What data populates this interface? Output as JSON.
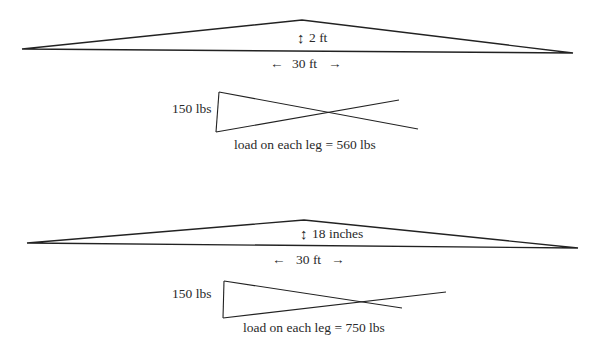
{
  "colors": {
    "background": "#ffffff",
    "line": "#222222",
    "text": "#2a2a2a"
  },
  "diagrams": [
    {
      "id": "truss-2ft",
      "span_label": "30 ft",
      "height_label": "2 ft",
      "arrow_left": "←",
      "arrow_right": "→",
      "updown_arrow": "↕",
      "triangle": {
        "left": [
          22,
          49
        ],
        "apex": [
          302,
          20
        ],
        "right": [
          573,
          53
        ]
      },
      "detail": {
        "force_label": "150 lbs",
        "load_label": "load on each leg = 560 lbs",
        "vertical": [
          [
            219,
            92
          ],
          [
            216,
            132
          ]
        ],
        "leg_a": [
          [
            219,
            92
          ],
          [
            418,
            129
          ]
        ],
        "leg_b": [
          [
            216,
            132
          ],
          [
            399,
            100
          ]
        ]
      }
    },
    {
      "id": "truss-18in",
      "span_label": "30 ft",
      "height_label": "18 inches",
      "arrow_left": "←",
      "arrow_right": "→",
      "updown_arrow": "↕",
      "triangle": {
        "left": [
          27,
          243
        ],
        "apex": [
          304,
          220
        ],
        "right": [
          578,
          248
        ]
      },
      "detail": {
        "force_label": "150 lbs",
        "load_label": "load on each leg = 750 lbs",
        "vertical": [
          [
            224,
            281
          ],
          [
            223,
            318
          ]
        ],
        "leg_a": [
          [
            224,
            281
          ],
          [
            402,
            308
          ]
        ],
        "leg_b": [
          [
            223,
            318
          ],
          [
            446,
            292
          ]
        ]
      }
    }
  ]
}
